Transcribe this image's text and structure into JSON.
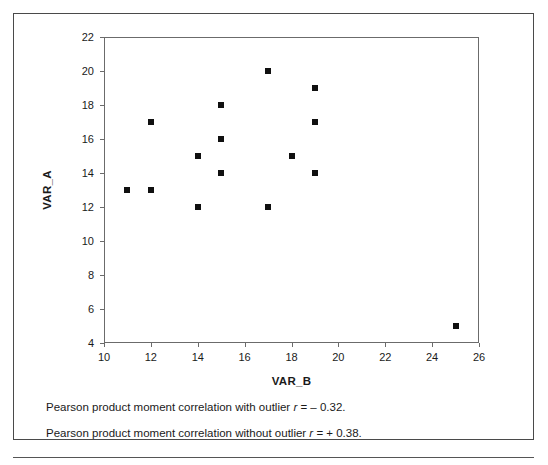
{
  "chart_data": {
    "type": "scatter",
    "title": "",
    "xlabel": "VAR_B",
    "ylabel": "VAR_A",
    "xlim": [
      10,
      26
    ],
    "ylim": [
      4,
      22
    ],
    "xticks": [
      10,
      12,
      14,
      16,
      18,
      20,
      22,
      24,
      26
    ],
    "yticks": [
      4,
      6,
      8,
      10,
      12,
      14,
      16,
      18,
      20,
      22
    ],
    "grid": false,
    "legend": null,
    "marker": "filled-square",
    "marker_color": "#101010",
    "series": [
      {
        "name": "VAR_A vs VAR_B",
        "points": [
          {
            "x": 11,
            "y": 13
          },
          {
            "x": 12,
            "y": 17
          },
          {
            "x": 12,
            "y": 13
          },
          {
            "x": 14,
            "y": 15
          },
          {
            "x": 14,
            "y": 12
          },
          {
            "x": 15,
            "y": 18
          },
          {
            "x": 15,
            "y": 16
          },
          {
            "x": 15,
            "y": 14
          },
          {
            "x": 17,
            "y": 20
          },
          {
            "x": 17,
            "y": 12
          },
          {
            "x": 18,
            "y": 15
          },
          {
            "x": 19,
            "y": 19
          },
          {
            "x": 19,
            "y": 17
          },
          {
            "x": 19,
            "y": 14
          },
          {
            "x": 25,
            "y": 5
          }
        ]
      }
    ],
    "annotations": [
      "Pearson product moment correlation with outlier r = – 0.32.",
      "Pearson product moment correlation without outlier r = + 0.38."
    ]
  },
  "caption": {
    "line1": {
      "prefix": "Pearson product moment correlation with outlier ",
      "symbol": "r",
      "value": " = – 0.32."
    },
    "line2": {
      "prefix": "Pearson product moment correlation without outlier ",
      "symbol": "r",
      "value": " = + 0.38."
    }
  }
}
